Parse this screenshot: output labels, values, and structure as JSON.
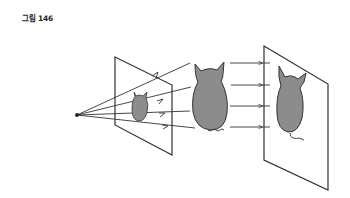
{
  "figure": {
    "caption": "그림 146",
    "colors": {
      "line": "#333333",
      "cat_fill": "#8c8c8c",
      "background": "#ffffff"
    },
    "elements": [
      {
        "id": "eye-point",
        "label": "viewpoint"
      },
      {
        "id": "near-plane",
        "label": "picture plane (converging projection)"
      },
      {
        "id": "small-cat-image",
        "label": "projected small cat"
      },
      {
        "id": "cat-object",
        "label": "cat object"
      },
      {
        "id": "far-plane",
        "label": "parallel projection plane"
      },
      {
        "id": "projected-cat",
        "label": "parallel projected cat"
      }
    ]
  }
}
